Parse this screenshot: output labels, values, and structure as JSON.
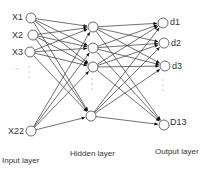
{
  "diagram": {
    "type": "neural-network",
    "input_layer": {
      "label": "Input layer",
      "nodes": [
        {
          "label": "X1",
          "x": 31,
          "y": 18
        },
        {
          "label": "X2",
          "x": 33,
          "y": 35
        },
        {
          "label": "X3",
          "x": 30,
          "y": 52
        },
        {
          "label": "X22",
          "x": 31,
          "y": 131
        }
      ],
      "ellipsis": "⋮"
    },
    "hidden_layer": {
      "label": "Hidden layer",
      "nodes": [
        {
          "x": 93,
          "y": 27
        },
        {
          "x": 93,
          "y": 48
        },
        {
          "x": 93,
          "y": 67
        },
        {
          "x": 91,
          "y": 116
        }
      ],
      "ellipsis": "⋮"
    },
    "output_layer": {
      "label": "Output layer",
      "nodes": [
        {
          "label": "d1",
          "x": 163,
          "y": 23
        },
        {
          "label": "d2",
          "x": 164,
          "y": 43
        },
        {
          "label": "d3",
          "x": 165,
          "y": 66
        },
        {
          "label": "D13",
          "x": 164,
          "y": 125
        }
      ],
      "ellipsis": "⋮"
    },
    "colors": {
      "line": "#333333",
      "node_stroke": "#444444",
      "arrow": "#111111"
    }
  }
}
